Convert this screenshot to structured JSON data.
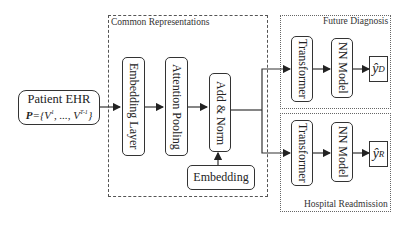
{
  "diagram": {
    "input": {
      "title": "Patient EHR",
      "formula_prefix": "P",
      "formula_rest": "={V",
      "sup1": "1",
      "middle": ", ..., V",
      "sup2": "T-1",
      "close": "}"
    },
    "common": {
      "label": "Common Representations",
      "embedding_layer": "Embedding Layer",
      "attention_pooling": "Attention Pooling",
      "add_norm": "Add & Norm",
      "embedding": "Embedding"
    },
    "future_diagnosis": {
      "label": "Future Diagnosis",
      "transformer": "Transformer",
      "nn_model": "NN Model",
      "output_symbol": "ŷ",
      "output_sub": "D"
    },
    "hospital_readmission": {
      "label": "Hospital Readmission",
      "transformer": "Transformer",
      "nn_model": "NN Model",
      "output_symbol": "ŷ",
      "output_sub": "R"
    }
  }
}
